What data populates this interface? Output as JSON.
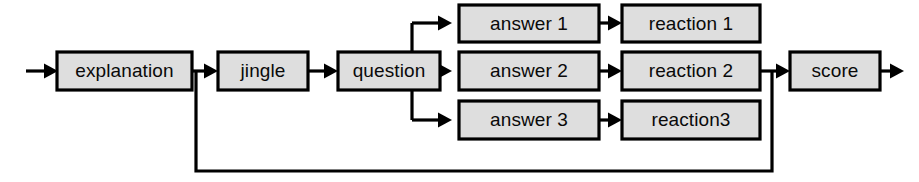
{
  "diagram": {
    "type": "flowchart",
    "orientation": "left-to-right",
    "title": "",
    "colors": {
      "node_fill": "#dedede",
      "node_border": "#000000",
      "edge": "#000000",
      "label": "#0a0a0a",
      "background": "#ffffff"
    },
    "nodes": [
      {
        "id": "explanation",
        "label": "explanation",
        "x": 57,
        "y": 52,
        "w": 135,
        "h": 38,
        "column": 1,
        "row": "middle"
      },
      {
        "id": "jingle",
        "label": "jingle",
        "x": 218,
        "y": 52,
        "w": 90,
        "h": 38,
        "column": 2,
        "row": "middle"
      },
      {
        "id": "question",
        "label": "question",
        "x": 338,
        "y": 52,
        "w": 102,
        "h": 38,
        "column": 3,
        "row": "middle"
      },
      {
        "id": "answer1",
        "label": "answer 1",
        "x": 459,
        "y": 5,
        "w": 140,
        "h": 37,
        "column": 4,
        "row": "top"
      },
      {
        "id": "answer2",
        "label": "answer 2",
        "x": 459,
        "y": 52,
        "w": 140,
        "h": 38,
        "column": 4,
        "row": "middle"
      },
      {
        "id": "answer3",
        "label": "answer 3",
        "x": 459,
        "y": 101,
        "w": 140,
        "h": 38,
        "column": 4,
        "row": "bottom"
      },
      {
        "id": "reaction1",
        "label": "reaction 1",
        "x": 622,
        "y": 5,
        "w": 138,
        "h": 37,
        "column": 5,
        "row": "top"
      },
      {
        "id": "reaction2",
        "label": "reaction 2",
        "x": 622,
        "y": 52,
        "w": 138,
        "h": 38,
        "column": 5,
        "row": "middle"
      },
      {
        "id": "reaction3",
        "label": "reaction3",
        "x": 622,
        "y": 101,
        "w": 138,
        "h": 38,
        "column": 5,
        "row": "bottom"
      },
      {
        "id": "score",
        "label": "score",
        "x": 790,
        "y": 52,
        "w": 90,
        "h": 38,
        "column": 6,
        "row": "middle"
      }
    ],
    "edges": [
      {
        "id": "start-to-explanation",
        "from": "start",
        "to": "explanation",
        "label": ""
      },
      {
        "id": "explanation-to-jingle",
        "from": "explanation",
        "to": "jingle",
        "label": ""
      },
      {
        "id": "jingle-to-question",
        "from": "jingle",
        "to": "question",
        "label": ""
      },
      {
        "id": "question-to-answer1",
        "from": "question",
        "to": "answer1",
        "label": ""
      },
      {
        "id": "question-to-answer2",
        "from": "question",
        "to": "answer2",
        "label": ""
      },
      {
        "id": "question-to-answer3",
        "from": "question",
        "to": "answer3",
        "label": ""
      },
      {
        "id": "answer1-to-reaction1",
        "from": "answer1",
        "to": "reaction1",
        "label": ""
      },
      {
        "id": "answer2-to-reaction2",
        "from": "answer2",
        "to": "reaction2",
        "label": ""
      },
      {
        "id": "answer3-to-reaction3",
        "from": "answer3",
        "to": "reaction3",
        "label": ""
      },
      {
        "id": "reaction2-to-score",
        "from": "reaction2",
        "to": "score",
        "label": ""
      },
      {
        "id": "score-to-end",
        "from": "score",
        "to": "end",
        "label": ""
      },
      {
        "id": "score-feedback-to-jingle",
        "from": "score",
        "to": "jingle",
        "label": "",
        "style": "feedback-loop"
      }
    ]
  }
}
